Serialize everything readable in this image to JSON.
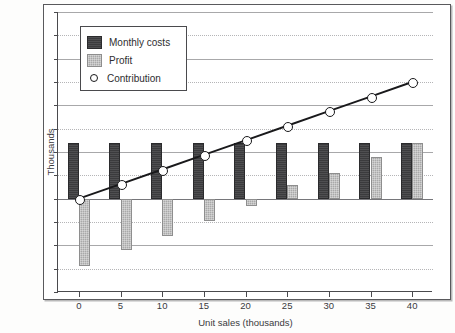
{
  "chart_data": {
    "type": "bar",
    "title": "",
    "xlabel": "Unit sales (thousands)",
    "ylabel": "Thousands",
    "categories": [
      "0",
      "5",
      "10",
      "15",
      "20",
      "25",
      "30",
      "35",
      "40"
    ],
    "x": [
      0,
      5,
      10,
      15,
      20,
      25,
      30,
      35,
      40
    ],
    "series": [
      {
        "name": "Monthly costs",
        "type": "bar",
        "color": "#3b3b3d",
        "values": [
          24,
          24,
          24,
          24,
          24,
          24,
          24,
          24,
          24
        ]
      },
      {
        "name": "Profit",
        "type": "bar",
        "color": "#a9a9a9",
        "values": [
          -29,
          -22,
          -16,
          -9.5,
          -3,
          6,
          11,
          18,
          24
        ]
      },
      {
        "name": "Contribution",
        "type": "line",
        "color": "#19191b",
        "marker": "open-circle",
        "values": [
          0,
          6.25,
          12.5,
          18.75,
          25,
          31.25,
          37.5,
          43.75,
          50
        ]
      }
    ],
    "ylim": [
      -40,
      80
    ],
    "ytick_step": 10,
    "ytick_labels": [
      "$80",
      "$70",
      "$60",
      "$50",
      "$40",
      "$30",
      "$20",
      "$10",
      "$0",
      "-$10",
      "-$20",
      "-$30",
      "-$40"
    ],
    "ytick_values": [
      80,
      70,
      60,
      50,
      40,
      30,
      20,
      10,
      0,
      -10,
      -20,
      -30,
      -40
    ],
    "xtick_labels": [
      "0",
      "5",
      "10",
      "15",
      "20",
      "25",
      "30",
      "35",
      "40"
    ],
    "grid": true,
    "legend_position": "top-left",
    "legend_entries": [
      "Monthly costs",
      "Profit",
      "Contribution"
    ]
  },
  "legend": {
    "items": [
      {
        "label": "Monthly costs",
        "icon": "bar-swatch-dark"
      },
      {
        "label": "Profit",
        "icon": "bar-swatch-gray"
      },
      {
        "label": "Contribution",
        "icon": "open-circle-marker"
      }
    ]
  },
  "axes": {
    "y_title": "Thousands",
    "x_title": "Unit sales (thousands)"
  }
}
